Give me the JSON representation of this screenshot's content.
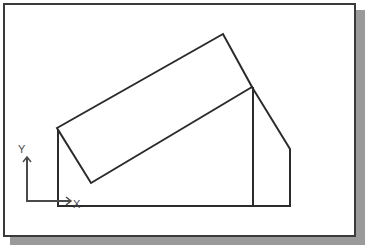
{
  "window": {
    "title": "",
    "background_color": "#ffffff",
    "border_color": "#3a3a3a",
    "shadow_color": "#9a9a9a"
  },
  "drawing": {
    "name": "tilted-panel-over-chamfered-block",
    "line_color": "#2b2b2b",
    "line_width": "2",
    "fill_color": "#ffffff",
    "shapes": [
      {
        "name": "chamfered-block",
        "type": "polygon",
        "points": "53,123 53,201 285,201 285,144 247,82",
        "closed": "true"
      },
      {
        "name": "tilted-panel",
        "type": "polygon",
        "points": "52,123 218,29 247,82 86,178",
        "closed": "true"
      },
      {
        "name": "inner-vertical-edge",
        "type": "line",
        "points": "248,82 248,201"
      }
    ]
  },
  "ucs_icon": {
    "name": "ucs-axis-icon",
    "color": "#4a4a4a",
    "origin": "22,196",
    "x_axis_end": "66,196",
    "y_axis_end": "22,152",
    "x_label": "X",
    "y_label": "Y",
    "x_label_pos": "69,202",
    "y_label_pos": "15,147"
  }
}
